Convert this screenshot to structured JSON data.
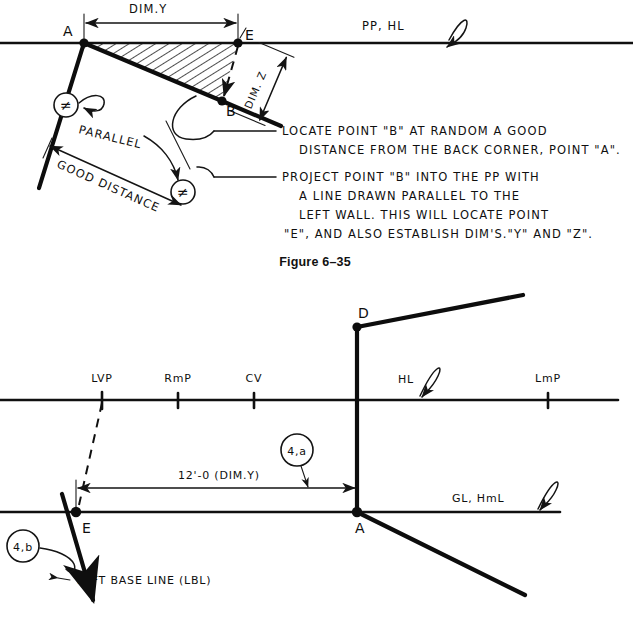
{
  "figure": {
    "caption_top": "Figure 6–35",
    "caption_bottom": ""
  },
  "top_diagram": {
    "dim_y_label": "DIM.Y",
    "dim_z_label": "DIM. Z",
    "point_a": "A",
    "point_b": "B",
    "point_e": "E",
    "picture_plane_label": "PP, HL",
    "parallel_label": "PARALLEL",
    "good_distance_label": "GOOD DISTANCE",
    "parallel_mark_glyph": "≠",
    "notes": [
      {
        "id": "note-locate-b",
        "lines": [
          "LOCATE POINT \"B\" AT RANDOM A GOOD",
          "DISTANCE FROM THE BACK CORNER, POINT \"A\"."
        ]
      },
      {
        "id": "note-project-b",
        "lines": [
          "PROJECT POINT \"B\" INTO THE PP WITH",
          "A LINE DRAWN PARALLEL TO THE",
          "LEFT WALL. THIS WILL LOCATE POINT",
          "\"E\", AND ALSO ESTABLISH DIM'S.\"Y\" AND \"Z\"."
        ]
      }
    ]
  },
  "bottom_diagram": {
    "horizon_labels": [
      {
        "name": "lvp",
        "label": "LVP"
      },
      {
        "name": "rmp",
        "label": "RmP"
      },
      {
        "name": "cv",
        "label": "CV"
      },
      {
        "name": "hl",
        "label": "HL"
      },
      {
        "name": "lmp",
        "label": "LmP"
      }
    ],
    "point_d": "D",
    "point_a": "A",
    "point_e": "E",
    "ground_line_label": "GL, HmL",
    "dimension_label": "12'-0 (DIM.Y)",
    "left_base_line_label": "LEFT BASE LINE (LBL)",
    "balloon_a": "4,a",
    "balloon_b": "4,b"
  },
  "colors": {
    "ink": "#0d0d0d",
    "paper": "#ffffff"
  }
}
